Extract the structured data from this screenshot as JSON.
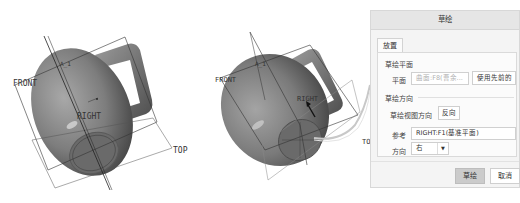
{
  "viewports": {
    "left": {
      "labels": {
        "front": "FRONT",
        "right": "RIGHT",
        "top": "TOP",
        "axis": "A_1"
      }
    },
    "right": {
      "labels": {
        "front": "FRONT",
        "right": "RIGHT",
        "top": "TOP",
        "axis": "A_1"
      }
    }
  },
  "dialog": {
    "title": "草绘",
    "tab_placement": "放置",
    "sketch_plane_section": "草绘平面",
    "plane_label": "平面",
    "plane_placeholder": "曲面:F8(曹余...",
    "use_previous_button": "使用先前的",
    "sketch_orientation_section": "草绘方向",
    "view_direction_label": "草绘视图方向",
    "flip_button": "反向",
    "reference_label": "参考",
    "reference_value": "RIGHT:F1(基准平面)",
    "direction_label": "方向",
    "direction_value": "右",
    "sketch_button": "草绘",
    "cancel_button": "取消"
  },
  "colors": {
    "mug_shade_dark": "#4a4a4a",
    "mug_shade_mid": "#8c8c8c",
    "mug_highlight": "#d8d8d8",
    "dialog_bg": "#f4f4f4",
    "primary_button": "#cbcbcb"
  }
}
